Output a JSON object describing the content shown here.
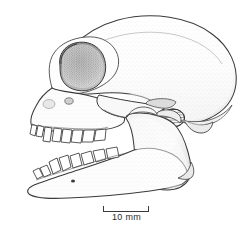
{
  "figure": {
    "caption_text": "",
    "view": "left lateral",
    "medium": "stippled pen-and-ink line drawing",
    "background_color": "#ffffff",
    "line_color": "#3a3a3a",
    "stipple_color": "#8d8d8d",
    "shadow_color": "#6f6f6f"
  },
  "scale_bar": {
    "label": "10 mm",
    "value": 10,
    "unit": "mm",
    "bar_length_px": 46,
    "tick_count": 2,
    "position": "below-illustration-center"
  },
  "anatomy": {
    "parts": [
      {
        "name": "braincase",
        "label": "cranium / braincase"
      },
      {
        "name": "orbit",
        "label": "orbit (eye socket)"
      },
      {
        "name": "zygomatic-arch",
        "label": "zygomatic arch"
      },
      {
        "name": "external-auditory-meatus",
        "label": "external auditory meatus"
      },
      {
        "name": "occipital",
        "label": "occipital region"
      },
      {
        "name": "mastoid-process",
        "label": "mastoid process"
      },
      {
        "name": "maxilla",
        "label": "maxilla with upper tooth row"
      },
      {
        "name": "premaxilla",
        "label": "premaxilla with incisors"
      },
      {
        "name": "mandible",
        "label": "mandible (lower jaw)"
      },
      {
        "name": "coronoid-process",
        "label": "coronoid process"
      },
      {
        "name": "mandibular-condyle",
        "label": "mandibular condyle"
      },
      {
        "name": "angular-process",
        "label": "angular process"
      },
      {
        "name": "mental-foramen",
        "label": "mental foramen"
      },
      {
        "name": "upper-teeth",
        "label": "upper dentition"
      },
      {
        "name": "lower-teeth",
        "label": "lower dentition"
      }
    ]
  }
}
